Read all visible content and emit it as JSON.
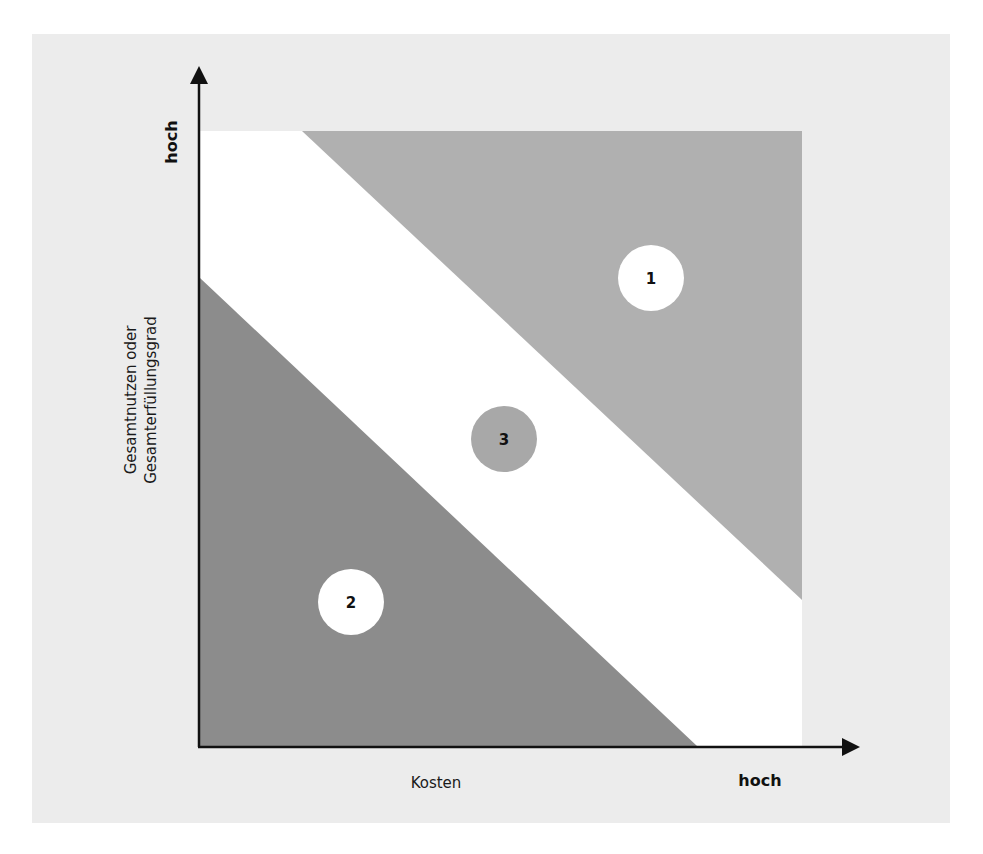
{
  "diagram": {
    "type": "portfolio-matrix",
    "x_axis": {
      "label": "Kosten",
      "high_label": "hoch"
    },
    "y_axis": {
      "label_line1": "Gesamtnutzen oder",
      "label_line2": "Gesamterfüllungsgrad",
      "high_label": "hoch"
    },
    "regions": [
      {
        "id": "1",
        "label": "1",
        "description": "upper-right triangle",
        "color": "#b0b0b0",
        "circle_color": "#ffffff"
      },
      {
        "id": "2",
        "label": "2",
        "description": "lower-left triangle",
        "color": "#8c8c8c",
        "circle_color": "#ffffff"
      },
      {
        "id": "3",
        "label": "3",
        "description": "diagonal band",
        "color": "#ffffff",
        "circle_color": "#a8a8a8"
      }
    ],
    "colors": {
      "panel_background": "#ececec",
      "axis": "#111111",
      "band": "#ffffff"
    }
  }
}
